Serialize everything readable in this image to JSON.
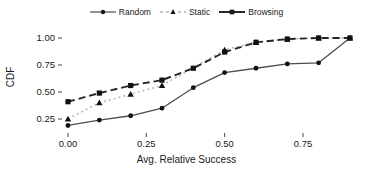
{
  "chart_data": {
    "type": "line",
    "title": "",
    "xlabel": "Avg. Relative Success",
    "ylabel": "CDF",
    "xlim": [
      -0.02,
      0.95
    ],
    "ylim": [
      0.15,
      1.05
    ],
    "xticks": [
      "0.00",
      "0.25",
      "0.50",
      "0.75"
    ],
    "xtick_values": [
      0.0,
      0.25,
      0.5,
      0.75
    ],
    "yticks": [
      "0.25",
      "0.50",
      "0.75",
      "1.00"
    ],
    "ytick_values": [
      0.25,
      0.5,
      0.75,
      1.0
    ],
    "grid": false,
    "legend_position": "top-center",
    "series": [
      {
        "name": "Random",
        "marker": "circle",
        "linestyle": "solid",
        "color": "#4d4d4d",
        "x": [
          0.0,
          0.1,
          0.2,
          0.3,
          0.4,
          0.5,
          0.6,
          0.7,
          0.8,
          0.9
        ],
        "values": [
          0.19,
          0.24,
          0.28,
          0.35,
          0.54,
          0.68,
          0.72,
          0.76,
          0.77,
          1.0
        ]
      },
      {
        "name": "Static",
        "marker": "triangle",
        "linestyle": "dotted",
        "color": "#b3b3b3",
        "x": [
          0.0,
          0.1,
          0.2,
          0.3,
          0.5,
          0.6,
          0.7,
          0.8,
          0.9
        ],
        "values": [
          0.25,
          0.4,
          0.48,
          0.56,
          0.89,
          0.96,
          0.99,
          1.0,
          1.0
        ]
      },
      {
        "name": "Browsing",
        "marker": "square",
        "linestyle": "dashed",
        "color": "#262626",
        "x": [
          0.0,
          0.1,
          0.2,
          0.3,
          0.4,
          0.5,
          0.6,
          0.7,
          0.8,
          0.9
        ],
        "values": [
          0.41,
          0.49,
          0.56,
          0.61,
          0.72,
          0.87,
          0.96,
          0.99,
          1.0,
          1.0
        ]
      }
    ]
  },
  "legend": {
    "items": [
      {
        "label": "Random"
      },
      {
        "label": "Static"
      },
      {
        "label": "Browsing"
      }
    ]
  },
  "axes": {
    "y_title": "CDF",
    "x_title": "Avg. Relative Success"
  }
}
